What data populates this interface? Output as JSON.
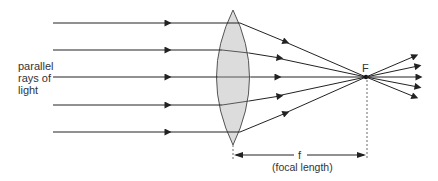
{
  "diagram": {
    "labels": {
      "incoming_rays_line1": "parallel",
      "incoming_rays_line2": "rays of",
      "incoming_rays_line3": "light",
      "focal_point": "F",
      "focal_length_symbol": "f",
      "focal_length_caption": "(focal length)"
    },
    "colors": {
      "ray": "#222222",
      "lens_fill": "#dcdcdc",
      "lens_stroke": "#555555",
      "text": "#333333"
    },
    "rays": [
      {
        "y": 23
      },
      {
        "y": 50
      },
      {
        "y": 77
      },
      {
        "y": 105
      },
      {
        "y": 132
      }
    ],
    "lens_x": 233,
    "focal_point": {
      "x": 366,
      "y": 77
    }
  }
}
